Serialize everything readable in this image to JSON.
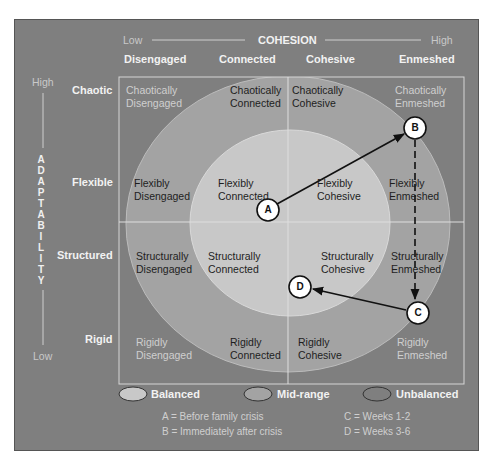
{
  "axes": {
    "cohesion": {
      "title": "COHESION",
      "low": "Low",
      "high": "High",
      "levels": [
        "Disengaged",
        "Connected",
        "Cohesive",
        "Enmeshed"
      ]
    },
    "adaptability": {
      "title": "ADAPTABILITY",
      "letters": [
        "A",
        "D",
        "A",
        "P",
        "T",
        "A",
        "B",
        "I",
        "L",
        "I",
        "T",
        "Y"
      ],
      "high": "High",
      "low": "Low",
      "levels": [
        "Chaotic",
        "Flexible",
        "Structured",
        "Rigid"
      ]
    }
  },
  "grid": {
    "rows": [
      {
        "level": "Chaotic",
        "cells": [
          {
            "line1": "Chaotically",
            "line2": "Disengaged",
            "zone": "unbalanced"
          },
          {
            "line1": "Chaotically",
            "line2": "Connected",
            "zone": "mid-range"
          },
          {
            "line1": "Chaotically",
            "line2": "Cohesive",
            "zone": "mid-range"
          },
          {
            "line1": "Chaotically",
            "line2": "Enmeshed",
            "zone": "unbalanced"
          }
        ]
      },
      {
        "level": "Flexible",
        "cells": [
          {
            "line1": "Flexibly",
            "line2": "Disengaged",
            "zone": "mid-range"
          },
          {
            "line1": "Flexibly",
            "line2": "Connected",
            "zone": "balanced"
          },
          {
            "line1": "Flexibly",
            "line2": "Cohesive",
            "zone": "balanced"
          },
          {
            "line1": "Flexibly",
            "line2": "Enmeshed",
            "zone": "mid-range"
          }
        ]
      },
      {
        "level": "Structured",
        "cells": [
          {
            "line1": "Structurally",
            "line2": "Disengaged",
            "zone": "mid-range"
          },
          {
            "line1": "Structurally",
            "line2": "Connected",
            "zone": "balanced"
          },
          {
            "line1": "Structurally",
            "line2": "Cohesive",
            "zone": "balanced"
          },
          {
            "line1": "Structurally",
            "line2": "Enmeshed",
            "zone": "mid-range"
          }
        ]
      },
      {
        "level": "Rigid",
        "cells": [
          {
            "line1": "Rigidly",
            "line2": "Disengaged",
            "zone": "unbalanced"
          },
          {
            "line1": "Rigidly",
            "line2": "Connected",
            "zone": "mid-range"
          },
          {
            "line1": "Rigidly",
            "line2": "Cohesive",
            "zone": "mid-range"
          },
          {
            "line1": "Rigidly",
            "line2": "Enmeshed",
            "zone": "unbalanced"
          }
        ]
      }
    ]
  },
  "markers": [
    {
      "label": "A",
      "x": 268,
      "y": 210
    },
    {
      "label": "B",
      "x": 415,
      "y": 128
    },
    {
      "label": "C",
      "x": 418,
      "y": 313
    },
    {
      "label": "D",
      "x": 300,
      "y": 287
    }
  ],
  "arrows": [
    {
      "from": "A",
      "to": "B",
      "style": "solid"
    },
    {
      "from": "B",
      "to": "C",
      "style": "dashed"
    },
    {
      "from": "C",
      "to": "D",
      "style": "solid"
    }
  ],
  "legend": {
    "items": [
      {
        "label": "Balanced",
        "color": "#c8c8c8"
      },
      {
        "label": "Mid-range",
        "color": "#a3a3a3"
      },
      {
        "label": "Unbalanced",
        "color": "#7f7f7f"
      }
    ],
    "key": [
      {
        "text": "A = Before family crisis"
      },
      {
        "text": "B = Immediately after crisis"
      },
      {
        "text": "C = Weeks 1-2"
      },
      {
        "text": "D = Weeks 3-6"
      }
    ]
  },
  "colors": {
    "background": "#7f7f7f",
    "mid_range": "#a3a3a3",
    "balanced": "#c8c8c8",
    "grid_line": "#d6d6d6",
    "marker_fill": "#ffffff",
    "arrow": "#111111"
  }
}
